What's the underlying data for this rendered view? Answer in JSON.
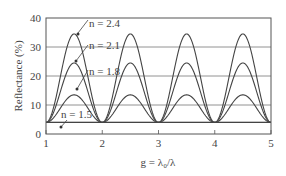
{
  "chart_data": {
    "type": "line",
    "title": "",
    "xlabel": "g = λ₀/λ",
    "ylabel": "Reflectance (%)",
    "xlim": [
      1,
      5
    ],
    "ylim": [
      0,
      40
    ],
    "xticks": [
      "1",
      "2",
      "3",
      "4",
      "5"
    ],
    "yticks": [
      "0",
      "10",
      "20",
      "30",
      "40"
    ],
    "grid": "horizontal",
    "baseline_reflectance": 4,
    "series": [
      {
        "name": "n = 2.4",
        "peak": 34.5,
        "min": 4
      },
      {
        "name": "n = 2.1",
        "peak": 24.5,
        "min": 4
      },
      {
        "name": "n = 1.8",
        "peak": 13.5,
        "min": 4
      },
      {
        "name": "n = 1.5",
        "peak": 4,
        "min": 4
      }
    ],
    "x_peaks": [
      1.5,
      2.5,
      3.5,
      4.5
    ],
    "x_minima": [
      1,
      2,
      3,
      4,
      5
    ]
  },
  "labels": {
    "n24": "n = 2.4",
    "n21": "n = 2.1",
    "n18": "n = 1.8",
    "n15": "n = 1.5"
  }
}
